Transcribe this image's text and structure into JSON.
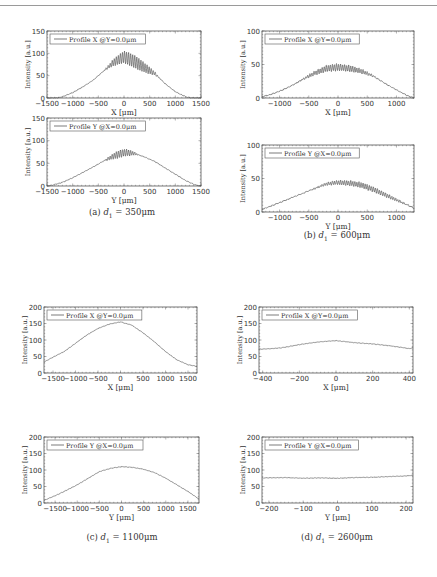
{
  "page": {
    "captions": [
      {
        "id": "a",
        "label": "(a)",
        "math": "d",
        "sub": "1",
        "eq": " = 350μm"
      },
      {
        "id": "b",
        "label": "(b)",
        "math": "d",
        "sub": "1",
        "eq": " = 600μm"
      },
      {
        "id": "c",
        "label": "(c)",
        "math": "d",
        "sub": "1",
        "eq": " = 1100μm"
      },
      {
        "id": "d",
        "label": "(d)",
        "math": "d",
        "sub": "1",
        "eq": " = 2600μm"
      }
    ]
  },
  "chart_data": [
    {
      "id": "a-x",
      "panel": "a",
      "type": "line",
      "legend": "Profile X @Y=0.0μm",
      "legend_position": "upper-left",
      "xlabel": "X [μm]",
      "ylabel": "Intensity [a.u.]",
      "xlim": [
        -1500,
        1500
      ],
      "ylim": [
        0,
        150
      ],
      "xticks": [
        -1500,
        -1000,
        -500,
        0,
        500,
        1000,
        1500
      ],
      "yticks": [
        0,
        50,
        100,
        150
      ],
      "grid": false,
      "x": [
        -1500,
        -1300,
        -1200,
        -1000,
        -800,
        -600,
        -400,
        -200,
        0,
        200,
        400,
        600,
        800,
        1000,
        1200,
        1300,
        1500
      ],
      "y": [
        0,
        0,
        3,
        12,
        25,
        40,
        60,
        80,
        92,
        82,
        68,
        55,
        32,
        14,
        3,
        0,
        0
      ],
      "fringes": {
        "from": -400,
        "to": 700,
        "period": 40,
        "amp": 14
      },
      "frame": {
        "x": 47,
        "y": 31,
        "w": 154,
        "h": 67
      }
    },
    {
      "id": "a-y",
      "panel": "a",
      "type": "line",
      "legend": "Profile Y @X=0.0μm",
      "legend_position": "upper-left",
      "xlabel": "Y [μm]",
      "ylabel": "Intensity [a.u.]",
      "xlim": [
        -1500,
        1500
      ],
      "ylim": [
        0,
        150
      ],
      "xticks": [
        -1500,
        -1000,
        -500,
        0,
        500,
        1000,
        1500
      ],
      "yticks": [
        0,
        50,
        100,
        150
      ],
      "grid": false,
      "x": [
        -1500,
        -1400,
        -1200,
        -1000,
        -800,
        -600,
        -400,
        -200,
        0,
        200,
        400,
        600,
        800,
        1000,
        1200,
        1400,
        1500
      ],
      "y": [
        0,
        2,
        8,
        18,
        30,
        42,
        55,
        66,
        74,
        72,
        64,
        54,
        40,
        26,
        12,
        2,
        0
      ],
      "fringes": {
        "from": -400,
        "to": 300,
        "period": 40,
        "amp": 8
      },
      "frame": {
        "x": 47,
        "y": 118,
        "w": 154,
        "h": 68
      }
    },
    {
      "id": "b-x",
      "panel": "b",
      "type": "line",
      "legend": "Profile X @Y=0.0μm",
      "legend_position": "upper-left",
      "xlabel": "X [μm]",
      "ylabel": "Intensity [a.u.]",
      "xlim": [
        -1300,
        1300
      ],
      "ylim": [
        0,
        100
      ],
      "xticks": [
        -1000,
        -500,
        0,
        500,
        1000
      ],
      "yticks": [
        0,
        50,
        100
      ],
      "grid": false,
      "x": [
        -1300,
        -1200,
        -1000,
        -800,
        -600,
        -400,
        -200,
        0,
        200,
        400,
        600,
        800,
        1000,
        1200,
        1300
      ],
      "y": [
        2,
        4,
        10,
        18,
        28,
        37,
        44,
        46,
        44,
        40,
        33,
        22,
        12,
        3,
        0
      ],
      "fringes": {
        "from": -700,
        "to": 700,
        "period": 35,
        "amp": 5
      },
      "frame": {
        "x": 262,
        "y": 31,
        "w": 152,
        "h": 67
      }
    },
    {
      "id": "b-y",
      "panel": "b",
      "type": "line",
      "legend": "Profile Y @X=0.0μm",
      "legend_position": "upper-left",
      "xlabel": "Y [μm]",
      "ylabel": "Intensity [a.u.]",
      "xlim": [
        -1300,
        1300
      ],
      "ylim": [
        0,
        100
      ],
      "xticks": [
        -1000,
        -500,
        0,
        500,
        1000
      ],
      "yticks": [
        0,
        50,
        100
      ],
      "grid": false,
      "x": [
        -1300,
        -1200,
        -1000,
        -800,
        -600,
        -400,
        -200,
        0,
        200,
        400,
        600,
        800,
        1000,
        1200,
        1300
      ],
      "y": [
        4,
        7,
        14,
        21,
        28,
        35,
        42,
        44,
        43,
        40,
        34,
        26,
        18,
        10,
        6
      ],
      "fringes": {
        "from": -500,
        "to": 1300,
        "period": 35,
        "amp": 4
      },
      "frame": {
        "x": 262,
        "y": 145,
        "w": 152,
        "h": 67
      }
    },
    {
      "id": "c-x",
      "panel": "c",
      "type": "line",
      "legend": "Profile X @Y=0.0μm",
      "legend_position": "upper-left",
      "xlabel": "X [μm]",
      "ylabel": "Intensity [a.u.]",
      "xlim": [
        -1700,
        1700
      ],
      "ylim": [
        0,
        200
      ],
      "xticks": [
        -1500,
        -1000,
        -500,
        0,
        500,
        1000,
        1500
      ],
      "yticks": [
        0,
        50,
        100,
        150,
        200
      ],
      "grid": false,
      "x": [
        -1700,
        -1500,
        -1250,
        -1000,
        -750,
        -500,
        -250,
        0,
        250,
        500,
        750,
        1000,
        1250,
        1500,
        1700
      ],
      "y": [
        33,
        48,
        65,
        90,
        115,
        135,
        148,
        155,
        145,
        122,
        95,
        65,
        40,
        25,
        20
      ],
      "fringes": {
        "from": 0,
        "to": 0,
        "period": 40,
        "amp": 0
      },
      "frame": {
        "x": 44,
        "y": 307,
        "w": 153,
        "h": 66
      }
    },
    {
      "id": "c-y",
      "panel": "c",
      "type": "line",
      "legend": "Profile Y @X=0.0μm",
      "legend_position": "upper-left",
      "xlabel": "Y [μm]",
      "ylabel": "Intensity [a.u.]",
      "xlim": [
        -1750,
        1750
      ],
      "ylim": [
        0,
        200
      ],
      "xticks": [
        -1500,
        -1000,
        -500,
        0,
        500,
        1000,
        1500
      ],
      "yticks": [
        0,
        50,
        100,
        150,
        200
      ],
      "grid": false,
      "x": [
        -1750,
        -1500,
        -1250,
        -1000,
        -750,
        -500,
        -250,
        0,
        250,
        500,
        750,
        1000,
        1250,
        1500,
        1750
      ],
      "y": [
        8,
        22,
        38,
        55,
        75,
        95,
        105,
        110,
        108,
        102,
        92,
        75,
        55,
        35,
        12
      ],
      "fringes": {
        "from": 0,
        "to": 0,
        "period": 40,
        "amp": 0
      },
      "frame": {
        "x": 44,
        "y": 437,
        "w": 155,
        "h": 66
      }
    },
    {
      "id": "d-x",
      "panel": "d",
      "type": "line",
      "legend": "Profile X @Y=0.0μm",
      "legend_position": "upper-left",
      "xlabel": "X [μm]",
      "ylabel": "Intensity [a.u.]",
      "xlim": [
        -420,
        420
      ],
      "ylim": [
        0,
        200
      ],
      "xticks": [
        -400,
        -200,
        0,
        200,
        400
      ],
      "yticks": [
        0,
        50,
        100,
        150,
        200
      ],
      "grid": false,
      "x": [
        -420,
        -350,
        -300,
        -200,
        -100,
        0,
        100,
        200,
        300,
        350,
        400,
        420
      ],
      "y": [
        72,
        74,
        76,
        86,
        94,
        98,
        92,
        88,
        82,
        78,
        74,
        76
      ],
      "fringes": {
        "from": 0,
        "to": 0,
        "period": 40,
        "amp": 0
      },
      "frame": {
        "x": 259,
        "y": 307,
        "w": 154,
        "h": 66
      }
    },
    {
      "id": "d-y",
      "panel": "d",
      "type": "line",
      "legend": "Profile Y @X=0.0μm",
      "legend_position": "upper-left",
      "xlabel": "Y [μm]",
      "ylabel": "Intensity [a.u.]",
      "xlim": [
        -220,
        220
      ],
      "ylim": [
        0,
        200
      ],
      "xticks": [
        -200,
        -100,
        0,
        100,
        200
      ],
      "yticks": [
        0,
        50,
        100,
        150,
        200
      ],
      "grid": false,
      "x": [
        -220,
        -150,
        -100,
        -50,
        0,
        50,
        100,
        150,
        200,
        220
      ],
      "y": [
        76,
        77,
        75,
        76,
        75,
        77,
        78,
        80,
        82,
        84
      ],
      "fringes": {
        "from": 0,
        "to": 0,
        "period": 40,
        "amp": 0
      },
      "frame": {
        "x": 262,
        "y": 437,
        "w": 151,
        "h": 66
      }
    }
  ]
}
